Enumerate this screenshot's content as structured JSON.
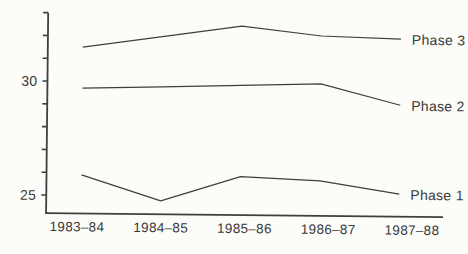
{
  "page": {
    "background_color": "#fcfcf9",
    "text_color": "#3a3a3a",
    "line_color": "#3f3f3f"
  },
  "chart_data": {
    "type": "line",
    "title": "",
    "xlabel": "",
    "ylabel": "",
    "categories": [
      "1983–84",
      "1984–85",
      "1985–86",
      "1986–87",
      "1987–88"
    ],
    "series": [
      {
        "name": "Phase 3",
        "values": [
          31.5,
          32.0,
          32.5,
          32.1,
          32.0
        ]
      },
      {
        "name": "Phase 2",
        "values": [
          29.7,
          29.8,
          29.9,
          30.0,
          29.1
        ]
      },
      {
        "name": "Phase 1",
        "values": [
          25.9,
          24.8,
          25.9,
          25.75,
          25.2
        ]
      }
    ],
    "y_axis": {
      "tick_min": 25,
      "tick_max": 33,
      "tick_step": 1,
      "labeled_ticks": [
        "30",
        "25"
      ],
      "labeled_tick_values": [
        30,
        25
      ]
    },
    "ylim": [
      24.2,
      33
    ],
    "grid": false,
    "legend_position": "inline-right-of-line-ends"
  }
}
